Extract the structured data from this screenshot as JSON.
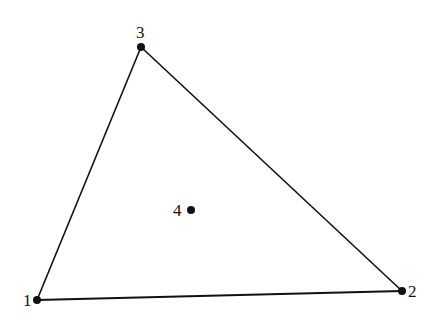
{
  "diagram": {
    "type": "triangle-with-interior-point",
    "colors": {
      "stroke": "#111111",
      "point": "#111111",
      "background": "#ffffff"
    },
    "vertices": [
      {
        "id": "1",
        "label": "1",
        "x": 37,
        "y": 300
      },
      {
        "id": "2",
        "label": "2",
        "x": 402,
        "y": 291
      },
      {
        "id": "3",
        "label": "3",
        "x": 141,
        "y": 47
      }
    ],
    "interior_point": {
      "id": "4",
      "label": "4",
      "x": 191,
      "y": 210
    },
    "edges": [
      {
        "from": "1",
        "to": "2"
      },
      {
        "from": "2",
        "to": "3"
      },
      {
        "from": "3",
        "to": "1"
      }
    ]
  }
}
